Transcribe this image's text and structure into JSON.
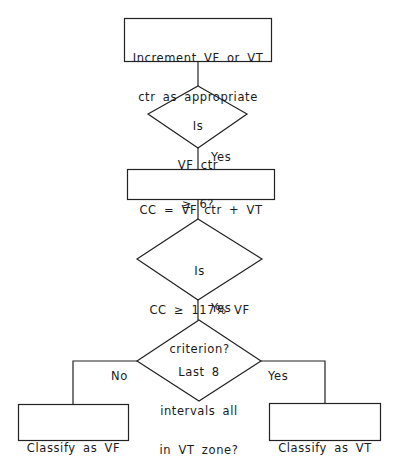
{
  "diagram": {
    "type": "flowchart",
    "nodes": {
      "increment": {
        "kind": "process",
        "lines": [
          "Increment VF or VT",
          "ctr as appropriate"
        ]
      },
      "vf_ctr_check": {
        "kind": "decision",
        "lines": [
          "Is",
          "VF ctr",
          "≥ 6?"
        ]
      },
      "cc_calc": {
        "kind": "process",
        "lines": [
          "CC = VF ctr + VT"
        ]
      },
      "cc_check": {
        "kind": "decision",
        "lines": [
          "Is",
          "CC ≥ 117% VF",
          "criterion?"
        ]
      },
      "last8_check": {
        "kind": "decision",
        "lines": [
          "Last 8",
          "intervals all",
          "in VT zone?"
        ]
      },
      "classify_vf": {
        "kind": "terminal",
        "lines": [
          "Classify as VF"
        ]
      },
      "classify_vt": {
        "kind": "terminal",
        "lines": [
          "Classify as VT"
        ]
      }
    },
    "edge_labels": {
      "vf_ctr_yes": "Yes",
      "cc_yes": "Yes",
      "last8_no": "No",
      "last8_yes": "Yes"
    },
    "edges": [
      {
        "from": "increment",
        "to": "vf_ctr_check",
        "label": ""
      },
      {
        "from": "vf_ctr_check",
        "to": "cc_calc",
        "label": "Yes"
      },
      {
        "from": "cc_calc",
        "to": "cc_check",
        "label": ""
      },
      {
        "from": "cc_check",
        "to": "last8_check",
        "label": "Yes"
      },
      {
        "from": "last8_check",
        "to": "classify_vf",
        "label": "No"
      },
      {
        "from": "last8_check",
        "to": "classify_vt",
        "label": "Yes"
      }
    ],
    "colors": {
      "stroke": "#222222",
      "text": "#1a1a1a",
      "background": "#ffffff"
    }
  }
}
